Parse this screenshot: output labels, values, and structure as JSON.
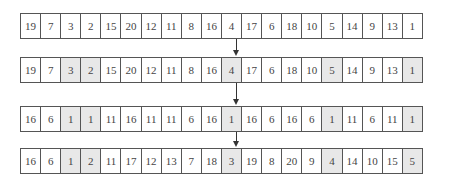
{
  "rows": [
    {
      "values": [
        "19",
        "7",
        "3",
        "2",
        "15",
        "20",
        "12",
        "11",
        "8",
        "16",
        "4",
        "17",
        "6",
        "18",
        "10",
        "5",
        "14",
        "9",
        "13",
        "1"
      ],
      "highlighted": []
    },
    {
      "values": [
        "19",
        "7",
        "3",
        "2",
        "15",
        "20",
        "12",
        "11",
        "8",
        "16",
        "4",
        "17",
        "6",
        "18",
        "10",
        "5",
        "14",
        "9",
        "13",
        "1"
      ],
      "highlighted": [
        2,
        3,
        10,
        15,
        19
      ]
    },
    {
      "values": [
        "16",
        "6",
        "1",
        "1",
        "11",
        "16",
        "11",
        "11",
        "6",
        "16",
        "1",
        "16",
        "6",
        "16",
        "6",
        "1",
        "11",
        "6",
        "11",
        "1"
      ],
      "highlighted": [
        2,
        3,
        10,
        15,
        19
      ]
    },
    {
      "values": [
        "16",
        "6",
        "1",
        "2",
        "11",
        "17",
        "12",
        "13",
        "7",
        "18",
        "3",
        "19",
        "8",
        "20",
        "9",
        "4",
        "14",
        "10",
        "15",
        "5"
      ],
      "highlighted": [
        2,
        3,
        10,
        15,
        19
      ]
    }
  ],
  "arrows": [
    {
      "from_row": 0,
      "to_row": 1,
      "icon": "arrow-down-icon"
    },
    {
      "from_row": 1,
      "to_row": 2,
      "icon": "arrow-down-icon"
    },
    {
      "from_row": 2,
      "to_row": 3,
      "icon": "arrow-down-icon"
    }
  ],
  "colors": {
    "highlight": "#e8e8e8",
    "border": "#555555",
    "text": "#444444"
  }
}
